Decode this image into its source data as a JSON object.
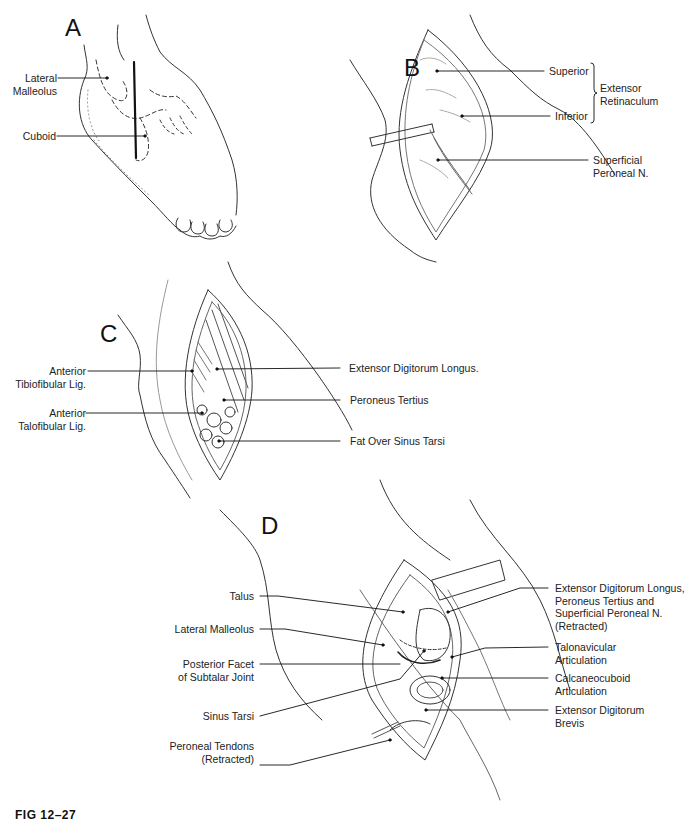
{
  "figure": {
    "caption": "FIG 12–27",
    "panels": {
      "A": {
        "letter": "A",
        "labels": {
          "lateral_malleolus": [
            "Lateral",
            "Malleolus"
          ],
          "cuboid": "Cuboid"
        }
      },
      "B": {
        "letter": "B",
        "labels": {
          "superior": "Superior",
          "inferior": "Inferior",
          "group": [
            "Extensor",
            "Retinaculum"
          ],
          "superficial_peroneal": [
            "Superficial",
            "Peroneal N."
          ]
        }
      },
      "C": {
        "letter": "C",
        "labels": {
          "ant_tibiofibular": [
            "Anterior",
            "Tibiofibular Lig."
          ],
          "ant_talofibular": [
            "Anterior",
            "Talofibular Lig."
          ],
          "edl": "Extensor Digitorum Longus.",
          "peroneus_tertius": "Peroneus Tertius",
          "fat_sinus": "Fat Over Sinus Tarsi"
        }
      },
      "D": {
        "letter": "D",
        "labels": {
          "talus": "Talus",
          "lateral_malleolus": "Lateral Malleolus",
          "posterior_facet": [
            "Posterior Facet",
            "of Subtalar Joint"
          ],
          "sinus_tarsi": "Sinus Tarsi",
          "peroneal_tendons": [
            "Peroneal Tendons",
            "(Retracted)"
          ],
          "edl_retracted": [
            "Extensor Digitorum Longus,",
            "Peroneus Tertius and",
            "Superficial Peroneal N.",
            "(Retracted)"
          ],
          "talonavicular": [
            "Talonavicular",
            "Articulation"
          ],
          "calcaneocuboid": [
            "Calcaneocuboid",
            "Articulation"
          ],
          "edb": [
            "Extensor Digitorum",
            "Brevis"
          ]
        }
      }
    }
  }
}
